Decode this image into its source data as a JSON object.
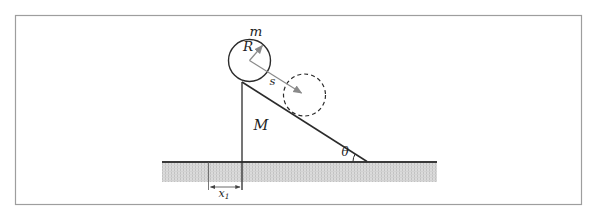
{
  "figure": {
    "labels": {
      "ball_mass": "m",
      "ball_radius": "R",
      "displacement": "s",
      "wedge_mass": "M",
      "incline_angle": "θ",
      "base_distance_main": "x",
      "base_distance_sub": "1"
    },
    "colors": {
      "line": "#2b2b2b",
      "gray_arrow": "#8a8a8a",
      "frame": "#9e9e9e",
      "ground_fill": "#dbdbdb",
      "ground_tex_v": "#c2c2c2",
      "ground_tex_h": "#d2d2d2",
      "ground_line": "#3a3a3a",
      "thin_line": "#555555",
      "dim_arrow": "#444444",
      "label": "#1e1e1e",
      "background": "#ffffff"
    }
  }
}
